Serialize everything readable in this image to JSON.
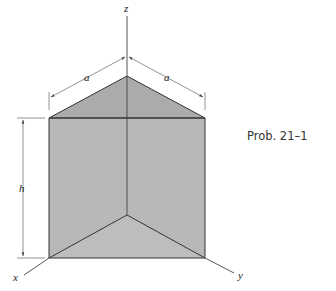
{
  "figure": {
    "caption": "Prob. 21–1",
    "labels": {
      "z_axis": "z",
      "x_axis": "x",
      "y_axis": "y",
      "dim_a_left": "a",
      "dim_a_right": "a",
      "dim_h": "h"
    },
    "colors": {
      "face_fill": "#b5b5b5",
      "top_fill": "#a9a9a9",
      "edge": "#333333",
      "dim_line": "#555555"
    }
  }
}
